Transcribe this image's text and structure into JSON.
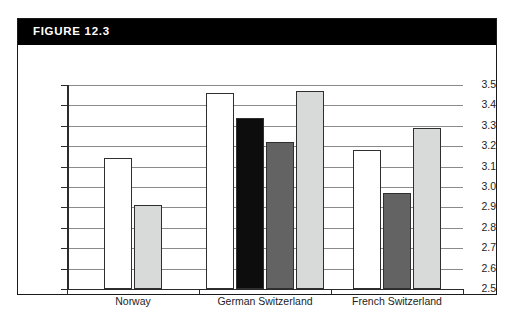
{
  "figure": {
    "header_label": "FIGURE 12.3",
    "header_bg": "#000000",
    "header_fg": "#ffffff",
    "border_color": "#1a1a1a"
  },
  "chart_data": {
    "type": "bar",
    "title": "FIGURE 12.3",
    "xlabel": "",
    "ylabel": "",
    "ylim": [
      2.5,
      3.5
    ],
    "grid": true,
    "legend": "none",
    "yticks": [
      "3.5",
      "3.4",
      "3.3",
      "3.2",
      "3.1",
      "3.0",
      "2.9",
      "2.8",
      "2.7",
      "2.6",
      "2.5"
    ],
    "ytick_values": [
      3.5,
      3.4,
      3.3,
      3.2,
      3.1,
      3.0,
      2.9,
      2.8,
      2.7,
      2.6,
      2.5
    ],
    "categories": [
      "Norway",
      "German Switzerland",
      "French Switzerland"
    ],
    "series": [
      {
        "name": "white",
        "fill": "#ffffff",
        "values": [
          3.14,
          3.46,
          3.18
        ]
      },
      {
        "name": "black",
        "fill": "#0d0d0d",
        "values": [
          null,
          3.34,
          null
        ]
      },
      {
        "name": "dark-gray",
        "fill": "#636363",
        "values": [
          null,
          3.22,
          2.97
        ]
      },
      {
        "name": "light-gray",
        "fill": "#d8dada",
        "values": [
          2.91,
          3.47,
          3.29
        ]
      }
    ],
    "bars": [
      {
        "category": "Norway",
        "series": "white",
        "value": 3.14,
        "fill": "#ffffff"
      },
      {
        "category": "Norway",
        "series": "light-gray",
        "value": 2.91,
        "fill": "#d8dada"
      },
      {
        "category": "German Switzerland",
        "series": "white",
        "value": 3.46,
        "fill": "#ffffff"
      },
      {
        "category": "German Switzerland",
        "series": "black",
        "value": 3.34,
        "fill": "#0d0d0d"
      },
      {
        "category": "German Switzerland",
        "series": "dark-gray",
        "value": 3.22,
        "fill": "#636363"
      },
      {
        "category": "German Switzerland",
        "series": "light-gray",
        "value": 3.47,
        "fill": "#d8dada"
      },
      {
        "category": "French Switzerland",
        "series": "white",
        "value": 3.18,
        "fill": "#ffffff"
      },
      {
        "category": "French Switzerland",
        "series": "dark-gray",
        "value": 2.97,
        "fill": "#636363"
      },
      {
        "category": "French Switzerland",
        "series": "light-gray",
        "value": 3.29,
        "fill": "#d8dada"
      }
    ]
  }
}
